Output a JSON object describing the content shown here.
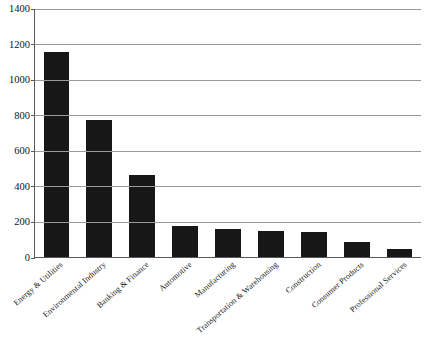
{
  "chart_data": {
    "type": "bar",
    "title": "",
    "subtitle": "",
    "xlabel": "",
    "ylabel": "",
    "ylim": [
      0,
      1400
    ],
    "ytick_step": 200,
    "yticks": [
      0,
      200,
      400,
      600,
      800,
      1000,
      1200,
      1400
    ],
    "grid": true,
    "legend": null,
    "legend_position": "none",
    "bar_color": "#171717",
    "grid_color": "#9a9a9a",
    "axis_color": "#595959",
    "background_color": "#ffffff",
    "categories": [
      "Energy & Utilities",
      "Environmental Industry",
      "Banking & Finance",
      "Automotive",
      "Manufacturing",
      "Transportation & Warehousing",
      "Construction",
      "Consumer Products",
      "Professional Services"
    ],
    "values": [
      1150,
      770,
      460,
      175,
      160,
      145,
      140,
      85,
      45
    ]
  }
}
